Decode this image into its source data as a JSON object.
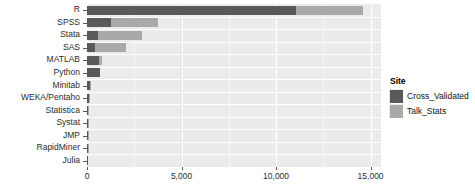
{
  "chart_data": {
    "type": "bar",
    "orientation": "horizontal",
    "stacked": true,
    "title": "",
    "xlabel": "",
    "ylabel": "",
    "categories": [
      "R",
      "SPSS",
      "Stata",
      "SAS",
      "MATLAB",
      "Python",
      "Minitab",
      "WEKA/Pentaho",
      "Statistica",
      "Systat",
      "JMP",
      "RapidMiner",
      "Julia"
    ],
    "series": [
      {
        "name": "Cross_Validated",
        "color": "#595959",
        "values": [
          11050,
          1280,
          580,
          420,
          640,
          700,
          150,
          120,
          60,
          55,
          45,
          40,
          30
        ]
      },
      {
        "name": "Talk_Stats",
        "color": "#A9A9A9",
        "values": [
          3550,
          2500,
          2330,
          1630,
          150,
          0,
          30,
          20,
          10,
          10,
          5,
          5,
          0
        ]
      }
    ],
    "totals": [
      14600,
      3780,
      2910,
      2050,
      790,
      700,
      180,
      140,
      70,
      65,
      50,
      45,
      30
    ],
    "xlim": [
      0,
      15550
    ],
    "xticks": [
      0,
      5000,
      10000,
      15000
    ],
    "xtick_labels": [
      "0",
      "5,000",
      "10,000",
      "15,000"
    ],
    "xminor": [
      2500,
      7500,
      12500
    ],
    "grid": true,
    "legend": {
      "title": "Site",
      "position": "right",
      "entries": [
        {
          "label": "Cross_Validated",
          "color": "#595959"
        },
        {
          "label": "Talk_Stats",
          "color": "#A9A9A9"
        }
      ]
    },
    "panel_background": "#EBEBEB",
    "gridline_color": "#FFFFFF"
  }
}
